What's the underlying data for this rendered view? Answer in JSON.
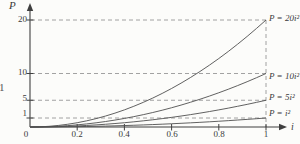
{
  "figure": {
    "background": "#fcfcfa",
    "axis_color": "#3f3f3f",
    "curve_color": "#4f4f4f",
    "dash_color": "#979797",
    "text_color": "#3a3a3a"
  },
  "axes": {
    "x_label": "i",
    "y_label": "P",
    "x_tick_labels": [
      "0",
      "0.2",
      "0.4",
      "0.6",
      "0.8",
      "1"
    ],
    "y_tick_labels": [
      "20",
      "10",
      "5",
      "1"
    ]
  },
  "stray_left_char": "1",
  "chart_data": {
    "type": "line",
    "title": "",
    "xlabel": "i",
    "ylabel": "P",
    "xlim": [
      0,
      1
    ],
    "ylim": [
      0,
      20
    ],
    "x_ticks": [
      0,
      0.2,
      0.4,
      0.6,
      0.8,
      1
    ],
    "reference_lines": {
      "horizontal_P": [
        20,
        10,
        5,
        1
      ],
      "vertical_i": [
        1
      ]
    },
    "grid": "dashed reference lines, no full grid",
    "legend_position": "labels at right end of each curve",
    "series": [
      {
        "name": "P = 20i²",
        "k": 20,
        "x": [
          0,
          0.2,
          0.4,
          0.6,
          0.8,
          1
        ],
        "values": [
          0,
          0.8,
          3.2,
          7.2,
          12.8,
          20
        ]
      },
      {
        "name": "P = 10i²",
        "k": 10,
        "x": [
          0,
          0.2,
          0.4,
          0.6,
          0.8,
          1
        ],
        "values": [
          0,
          0.4,
          1.6,
          3.6,
          6.4,
          10
        ]
      },
      {
        "name": "P = 5i²",
        "k": 5,
        "x": [
          0,
          0.2,
          0.4,
          0.6,
          0.8,
          1
        ],
        "values": [
          0,
          0.2,
          0.8,
          1.8,
          3.2,
          5
        ]
      },
      {
        "name": "P = i²",
        "k": 1,
        "x": [
          0,
          0.2,
          0.4,
          0.6,
          0.8,
          1
        ],
        "values": [
          0,
          0.04,
          0.16,
          0.36,
          0.64,
          1
        ]
      }
    ]
  }
}
